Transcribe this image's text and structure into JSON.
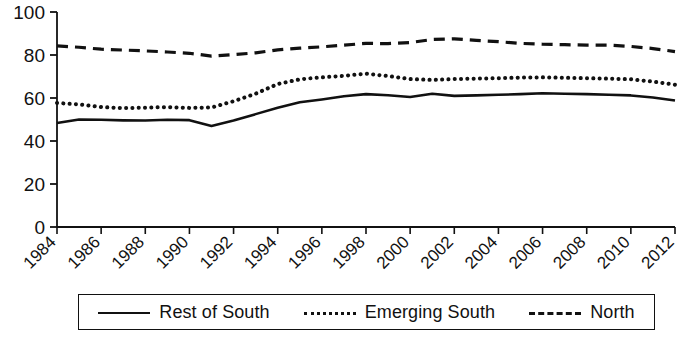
{
  "chart_data": {
    "type": "line",
    "title": "",
    "xlabel": "",
    "ylabel": "",
    "xlim": [
      1984,
      2012
    ],
    "ylim": [
      0,
      100
    ],
    "grid": false,
    "legend_position": "bottom",
    "y_ticks": [
      0,
      20,
      40,
      60,
      80,
      100
    ],
    "x_tick_labels": [
      "1984",
      "1986",
      "1988",
      "1990",
      "1992",
      "1994",
      "1996",
      "1998",
      "2000",
      "2002",
      "2004",
      "2006",
      "2008",
      "2010",
      "2012"
    ],
    "x": [
      1984,
      1985,
      1986,
      1987,
      1988,
      1989,
      1990,
      1991,
      1992,
      1993,
      1994,
      1995,
      1996,
      1997,
      1998,
      1999,
      2000,
      2001,
      2002,
      2003,
      2004,
      2005,
      2006,
      2007,
      2008,
      2009,
      2010,
      2011,
      2012
    ],
    "series": [
      {
        "name": "Rest of South",
        "style": "solid",
        "color": "#111111",
        "values": [
          48.4,
          50.0,
          49.9,
          49.6,
          49.5,
          49.9,
          49.7,
          47.0,
          49.5,
          52.5,
          55.5,
          58.0,
          59.3,
          60.8,
          61.8,
          61.3,
          60.5,
          62.0,
          61.0,
          61.2,
          61.5,
          61.8,
          62.2,
          62.0,
          61.8,
          61.5,
          61.2,
          60.2,
          58.8
        ]
      },
      {
        "name": "Emerging South",
        "style": "dotted",
        "color": "#111111",
        "values": [
          57.7,
          57.0,
          55.8,
          55.3,
          55.5,
          55.8,
          55.4,
          55.6,
          58.5,
          62.0,
          66.5,
          68.7,
          69.6,
          70.3,
          71.3,
          70.2,
          68.8,
          68.4,
          68.8,
          69.0,
          69.2,
          69.5,
          69.6,
          69.4,
          69.2,
          69.0,
          68.7,
          67.6,
          66.2
        ]
      },
      {
        "name": "North",
        "style": "dashed",
        "color": "#111111",
        "values": [
          84.2,
          83.6,
          82.7,
          82.3,
          81.9,
          81.4,
          80.8,
          79.5,
          80.2,
          81.0,
          82.4,
          83.2,
          83.8,
          84.6,
          85.4,
          85.3,
          85.8,
          87.2,
          87.5,
          86.8,
          86.2,
          85.4,
          85.0,
          84.8,
          84.6,
          84.6,
          84.0,
          83.0,
          81.6
        ]
      }
    ]
  },
  "legend": {
    "entries": [
      {
        "label": "Rest of South",
        "style": "solid"
      },
      {
        "label": "Emerging South",
        "style": "dotted"
      },
      {
        "label": "North",
        "style": "dashed"
      }
    ]
  }
}
